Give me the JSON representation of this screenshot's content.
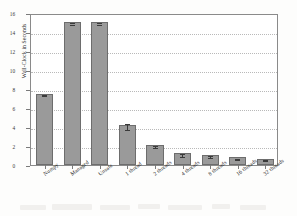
{
  "chart_data": {
    "type": "bar",
    "title": "",
    "xlabel": "",
    "ylabel": "Wall-Clock in Seconds",
    "ylim": [
      0,
      16
    ],
    "yticks": [
      0,
      2,
      4,
      6,
      8,
      10,
      12,
      14,
      16
    ],
    "grid": true,
    "legend": "none",
    "categories": [
      "Numpy",
      "Managed",
      "Unsafe",
      "1 thread",
      "2 threads",
      "4 threads",
      "8 threads",
      "16 threads",
      "32 threads"
    ],
    "values": [
      7.5,
      15.1,
      15.1,
      4.2,
      2.1,
      1.25,
      1.05,
      0.8,
      0.65
    ],
    "errors": [
      0.05,
      0.1,
      0.1,
      0.35,
      0.12,
      0.15,
      0.1,
      0.08,
      0.07
    ],
    "bar_color": "#9a9a9a",
    "bar_edge_color": "#6d6d6d",
    "error_color": "#3a3a3a",
    "grid_color": "#b9b9b9",
    "axis_color": "#8a8a8a"
  }
}
